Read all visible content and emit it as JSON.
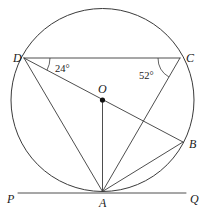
{
  "figure": {
    "kind": "circle-geometry-diagram",
    "width": 207,
    "height": 218,
    "background_color": "#ffffff",
    "stroke_color": "#3a3a3a",
    "label_color": "#1a1a1a"
  },
  "circle": {
    "center_label": "O",
    "center_x": 102.5,
    "center_y": 100,
    "radius": 91.5
  },
  "points": [
    {
      "id": "D",
      "label": "D",
      "x": 24,
      "y": 58,
      "label_x": 13,
      "label_y": 62
    },
    {
      "id": "C",
      "label": "C",
      "x": 180,
      "y": 58,
      "label_x": 186,
      "label_y": 62
    },
    {
      "id": "B",
      "label": "B",
      "x": 183,
      "y": 142,
      "label_x": 189,
      "label_y": 148
    },
    {
      "id": "A",
      "label": "A",
      "x": 102.5,
      "y": 191.5,
      "label_x": 99,
      "label_y": 207
    },
    {
      "id": "O",
      "label": "O",
      "x": 102.5,
      "y": 100,
      "label_x": 98,
      "label_y": 93
    },
    {
      "id": "P",
      "label": "P",
      "x": 18,
      "y": 193,
      "label_x": 7,
      "label_y": 203
    },
    {
      "id": "Q",
      "label": "Q",
      "x": 186,
      "y": 193,
      "label_x": 190,
      "label_y": 203
    }
  ],
  "segments": [
    {
      "id": "DC",
      "from": "D",
      "to": "C",
      "name": "chord-d-c"
    },
    {
      "id": "DB",
      "from": "D",
      "to": "B",
      "name": "chord-d-b"
    },
    {
      "id": "DA",
      "from": "D",
      "to": "A",
      "name": "chord-d-a"
    },
    {
      "id": "CA",
      "from": "C",
      "to": "A",
      "name": "chord-c-a"
    },
    {
      "id": "AB",
      "from": "A",
      "to": "B",
      "name": "chord-a-b"
    },
    {
      "id": "AO",
      "from": "A",
      "to": "O",
      "name": "radius-a-o"
    },
    {
      "id": "PQ",
      "from": "P",
      "to": "Q",
      "name": "tangent-line-p-q"
    }
  ],
  "angles": [
    {
      "id": "angle-at-D",
      "value": "24°",
      "vertex": "D",
      "between": [
        "C",
        "B"
      ],
      "label_x": 55,
      "label_y": 72,
      "arc_radius": 26
    },
    {
      "id": "angle-at-C",
      "value": "52°",
      "vertex": "C",
      "between": [
        "D",
        "A"
      ],
      "label_x": 139,
      "label_y": 79,
      "arc_radius": 22
    }
  ]
}
